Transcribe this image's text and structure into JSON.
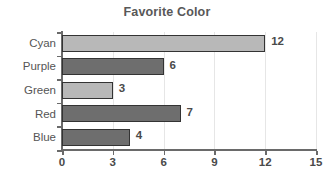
{
  "chart_data": {
    "type": "bar",
    "orientation": "horizontal",
    "title": "Favorite Color",
    "xlabel": "",
    "ylabel": "",
    "categories": [
      "Cyan",
      "Purple",
      "Green",
      "Red",
      "Blue"
    ],
    "values": [
      12,
      6,
      3,
      7,
      4
    ],
    "value_labels": [
      "12",
      "6",
      "3",
      "7",
      "4"
    ],
    "bar_colors": [
      "#b8b8b8",
      "#6e6e6e",
      "#b8b8b8",
      "#6e6e6e",
      "#6e6e6e"
    ],
    "bar_edge_color": "#333333",
    "xlim": [
      0,
      15
    ],
    "xticks": [
      0,
      3,
      6,
      9,
      12,
      15
    ],
    "xtick_labels": [
      "0",
      "3",
      "6",
      "9",
      "12",
      "15"
    ],
    "grid": true,
    "grid_axis": "x",
    "grid_color": "#e6e6e6",
    "legend": false,
    "background": "#ffffff",
    "title_color": "#585858",
    "axis_color": "#6a6a6a",
    "label_color": "#555555"
  }
}
